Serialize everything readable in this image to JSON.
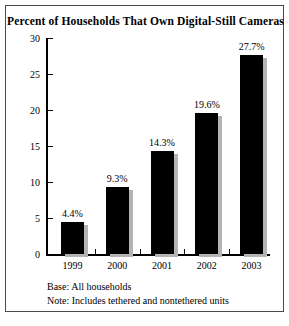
{
  "chart_data": {
    "type": "bar",
    "title": "Percent of Households That Own Digital-Still Cameras",
    "categories": [
      "1999",
      "2000",
      "2001",
      "2002",
      "2003"
    ],
    "values": [
      4.4,
      9.3,
      14.3,
      19.6,
      27.7
    ],
    "data_labels": [
      "4.4%",
      "9.3%",
      "14.3%",
      "19.6%",
      "27.7%"
    ],
    "xlabel": "",
    "ylabel": "",
    "ylim": [
      0,
      30
    ],
    "yticks": [
      0,
      5,
      10,
      15,
      20,
      25,
      30
    ],
    "ytick_labels": [
      "0",
      "5",
      "10",
      "15",
      "20",
      "25",
      "30"
    ],
    "grid": false,
    "legend": null,
    "bar_color": "#000000",
    "shadow_color": "#b4b4b4"
  },
  "notes": {
    "base": "Base: All households",
    "note": "Note: Includes tethered and nontethered units"
  }
}
